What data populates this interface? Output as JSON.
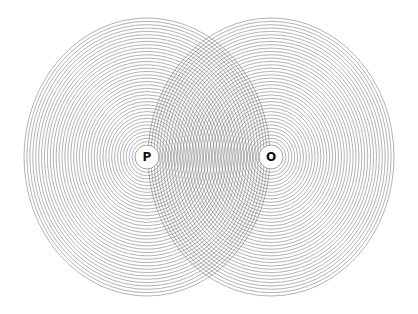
{
  "diagram": {
    "type": "concentric-ring interference",
    "background": "#ffffff",
    "ring_color": "#6e6e6e",
    "ring_stroke_width": 0.7,
    "ring_opacity": 0.75,
    "sources": [
      {
        "id": "source-p",
        "label": "P",
        "cx": 147,
        "cy": 157,
        "inner_radius": 12,
        "rx_max": 123,
        "ry_max": 139
      },
      {
        "id": "source-o",
        "label": "O",
        "cx": 271,
        "cy": 157,
        "inner_radius": 12,
        "rx_max": 123,
        "ry_max": 139
      }
    ],
    "ring_count": 38
  }
}
